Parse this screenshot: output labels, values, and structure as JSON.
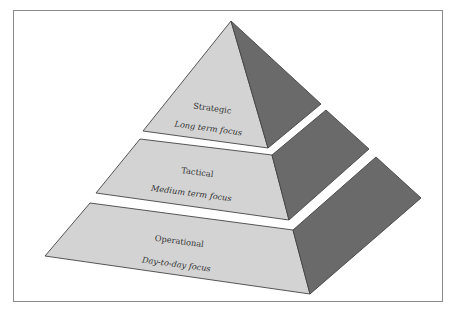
{
  "diagram": {
    "type": "pyramid",
    "colors": {
      "front_face": "#d3d3d3",
      "side_face": "#6a6a6a",
      "outline": "#444444",
      "frame": "#8a8a8a"
    },
    "tiers": [
      {
        "level": 1,
        "title": "Strategic",
        "subtitle": "Long term focus"
      },
      {
        "level": 2,
        "title": "Tactical",
        "subtitle": "Medium term focus"
      },
      {
        "level": 3,
        "title": "Operational",
        "subtitle": "Day-to-day focus"
      }
    ]
  }
}
